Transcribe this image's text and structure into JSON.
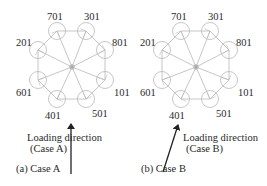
{
  "panels": [
    {
      "id": "a",
      "caption": "(a) Case A",
      "loading_label_line1": "Loading direction",
      "loading_label_line2": "(Case A)",
      "center": [
        72,
        67
      ],
      "nodes": [
        {
          "label": "701",
          "x": 57,
          "y": 31
        },
        {
          "label": "301",
          "x": 86,
          "y": 31
        },
        {
          "label": "801",
          "x": 105,
          "y": 50
        },
        {
          "label": "101",
          "x": 105,
          "y": 80
        },
        {
          "label": "501",
          "x": 86,
          "y": 99
        },
        {
          "label": "401",
          "x": 57,
          "y": 99
        },
        {
          "label": "601",
          "x": 38,
          "y": 80
        },
        {
          "label": "201",
          "x": 38,
          "y": 50
        }
      ],
      "arrow": {
        "x1": 71,
        "y1": 174,
        "x2": 71,
        "y2": 124
      }
    },
    {
      "id": "b",
      "caption": "(b) Case B",
      "loading_label_line1": "Loading direction",
      "loading_label_line2": "(Case B)",
      "center": [
        196,
        67
      ],
      "nodes": [
        {
          "label": "701",
          "x": 181,
          "y": 31
        },
        {
          "label": "301",
          "x": 210,
          "y": 31
        },
        {
          "label": "801",
          "x": 229,
          "y": 50
        },
        {
          "label": "101",
          "x": 229,
          "y": 80
        },
        {
          "label": "501",
          "x": 210,
          "y": 99
        },
        {
          "label": "401",
          "x": 181,
          "y": 99
        },
        {
          "label": "601",
          "x": 162,
          "y": 80
        },
        {
          "label": "201",
          "x": 162,
          "y": 50
        }
      ],
      "arrow": {
        "x1": 163,
        "y1": 172,
        "x2": 178,
        "y2": 125
      }
    }
  ],
  "colors": {
    "structure": "#b8b8b8",
    "arrow": "#222222",
    "text": "#2a2a2a"
  }
}
